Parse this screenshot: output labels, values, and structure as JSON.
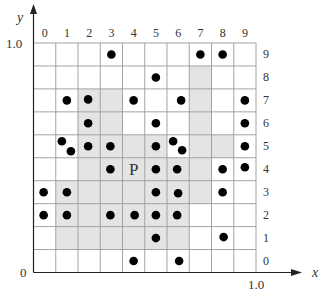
{
  "axes": {
    "y_label": "y",
    "x_label": "x",
    "y_max_label": "1.0",
    "x_max_label": "1.0",
    "origin_label": "0"
  },
  "grid": {
    "columns": 10,
    "rows": 10,
    "column_labels": [
      "0",
      "1",
      "2",
      "3",
      "4",
      "5",
      "6",
      "7",
      "8",
      "9"
    ],
    "row_labels": [
      "0",
      "1",
      "2",
      "3",
      "4",
      "5",
      "6",
      "7",
      "8",
      "9"
    ],
    "line_color": "#9a9a9a",
    "shade_color": "#e4e4e4",
    "dot_color": "#000000",
    "shaded_cells": [
      [
        7,
        8
      ],
      [
        2,
        7
      ],
      [
        3,
        7
      ],
      [
        7,
        7
      ],
      [
        2,
        6
      ],
      [
        3,
        6
      ],
      [
        7,
        6
      ],
      [
        2,
        5
      ],
      [
        3,
        5
      ],
      [
        4,
        5
      ],
      [
        5,
        5
      ],
      [
        7,
        5
      ],
      [
        8,
        5
      ],
      [
        2,
        4
      ],
      [
        3,
        4
      ],
      [
        4,
        4
      ],
      [
        5,
        4
      ],
      [
        6,
        4
      ],
      [
        7,
        4
      ],
      [
        1,
        3
      ],
      [
        2,
        3
      ],
      [
        3,
        3
      ],
      [
        4,
        3
      ],
      [
        5,
        3
      ],
      [
        6,
        3
      ],
      [
        7,
        3
      ],
      [
        1,
        2
      ],
      [
        2,
        2
      ],
      [
        3,
        2
      ],
      [
        4,
        2
      ],
      [
        5,
        2
      ],
      [
        6,
        2
      ],
      [
        1,
        1
      ],
      [
        2,
        1
      ],
      [
        3,
        1
      ],
      [
        4,
        1
      ],
      [
        5,
        1
      ],
      [
        6,
        1
      ]
    ],
    "point_label": {
      "text": "P",
      "col": 4,
      "row": 4
    },
    "points": [
      {
        "col": 3,
        "row": 9,
        "dx": 0,
        "dy": 0
      },
      {
        "col": 7,
        "row": 9,
        "dx": 0,
        "dy": 0
      },
      {
        "col": 8,
        "row": 9,
        "dx": 0,
        "dy": 0
      },
      {
        "col": 5,
        "row": 8,
        "dx": 0,
        "dy": 0
      },
      {
        "col": 1,
        "row": 7,
        "dx": 0,
        "dy": 0
      },
      {
        "col": 2,
        "row": 7,
        "dx": -1,
        "dy": -1
      },
      {
        "col": 4,
        "row": 7,
        "dx": 0,
        "dy": 0
      },
      {
        "col": 6,
        "row": 7,
        "dx": 3,
        "dy": 0
      },
      {
        "col": 9,
        "row": 7,
        "dx": 0,
        "dy": 0
      },
      {
        "col": 2,
        "row": 6,
        "dx": -1,
        "dy": 0
      },
      {
        "col": 5,
        "row": 6,
        "dx": 0,
        "dy": 0
      },
      {
        "col": 9,
        "row": 6,
        "dx": 0,
        "dy": 0
      },
      {
        "col": 1,
        "row": 5,
        "dx": -5,
        "dy": -5
      },
      {
        "col": 1,
        "row": 5,
        "dx": 4,
        "dy": 5
      },
      {
        "col": 2,
        "row": 5,
        "dx": -1,
        "dy": 0
      },
      {
        "col": 3,
        "row": 5,
        "dx": -1,
        "dy": 0
      },
      {
        "col": 5,
        "row": 5,
        "dx": 0,
        "dy": 0
      },
      {
        "col": 6,
        "row": 5,
        "dx": -5,
        "dy": -5
      },
      {
        "col": 6,
        "row": 5,
        "dx": 4,
        "dy": 4
      },
      {
        "col": 9,
        "row": 5,
        "dx": 0,
        "dy": 0
      },
      {
        "col": 3,
        "row": 4,
        "dx": -1,
        "dy": 0
      },
      {
        "col": 5,
        "row": 4,
        "dx": 0,
        "dy": 0
      },
      {
        "col": 6,
        "row": 4,
        "dx": -1,
        "dy": 0
      },
      {
        "col": 8,
        "row": 4,
        "dx": 0,
        "dy": 0
      },
      {
        "col": 9,
        "row": 4,
        "dx": 0,
        "dy": -2
      },
      {
        "col": 0,
        "row": 3,
        "dx": -1,
        "dy": 0
      },
      {
        "col": 1,
        "row": 3,
        "dx": 0,
        "dy": 0
      },
      {
        "col": 5,
        "row": 3,
        "dx": 0,
        "dy": 0
      },
      {
        "col": 6,
        "row": 3,
        "dx": 0,
        "dy": 1
      },
      {
        "col": 8,
        "row": 3,
        "dx": 0,
        "dy": 0
      },
      {
        "col": 0,
        "row": 2,
        "dx": -1,
        "dy": 0
      },
      {
        "col": 1,
        "row": 2,
        "dx": 0,
        "dy": 0
      },
      {
        "col": 3,
        "row": 2,
        "dx": -1,
        "dy": 0
      },
      {
        "col": 4,
        "row": 2,
        "dx": 1,
        "dy": 0
      },
      {
        "col": 5,
        "row": 2,
        "dx": 0,
        "dy": 0
      },
      {
        "col": 6,
        "row": 2,
        "dx": -1,
        "dy": 0
      },
      {
        "col": 5,
        "row": 1,
        "dx": 0,
        "dy": 0
      },
      {
        "col": 8,
        "row": 1,
        "dx": 1,
        "dy": -1
      },
      {
        "col": 4,
        "row": 0,
        "dx": 0,
        "dy": 0
      },
      {
        "col": 6,
        "row": 0,
        "dx": 1,
        "dy": 0
      }
    ]
  }
}
